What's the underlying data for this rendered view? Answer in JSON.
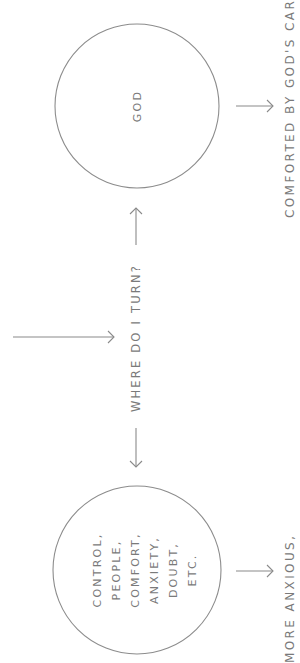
{
  "diagram": {
    "orientation": "rotated-90-ccw",
    "colors": {
      "background": "#ffffff",
      "stroke": "#8a8a8a",
      "text": "#7a7a7a"
    },
    "nodes": {
      "god": {
        "label": "GOD"
      },
      "idols": {
        "lines": [
          "CONTROL,",
          "PEOPLE,",
          "COMFORT,",
          "ANXIETY,",
          "DOUBT,",
          "ETC."
        ]
      }
    },
    "question": {
      "label": "WHERE DO I TURN?"
    },
    "outcomes": {
      "god": "COMFORTED BY GOD'S CARE",
      "idols": "MORE ANXIOUS,"
    }
  }
}
